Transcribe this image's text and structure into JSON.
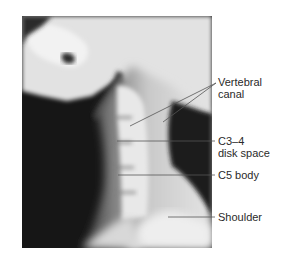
{
  "figure": {
    "labels": [
      {
        "id": "vertebral-canal",
        "line1": "Vertebral",
        "line2": "canal"
      },
      {
        "id": "c3-4-disk-space",
        "line1": "C3–4",
        "line2": "disk space"
      },
      {
        "id": "c5-body",
        "line1": "C5 body",
        "line2": ""
      },
      {
        "id": "shoulder",
        "line1": "Shoulder",
        "line2": ""
      }
    ]
  }
}
